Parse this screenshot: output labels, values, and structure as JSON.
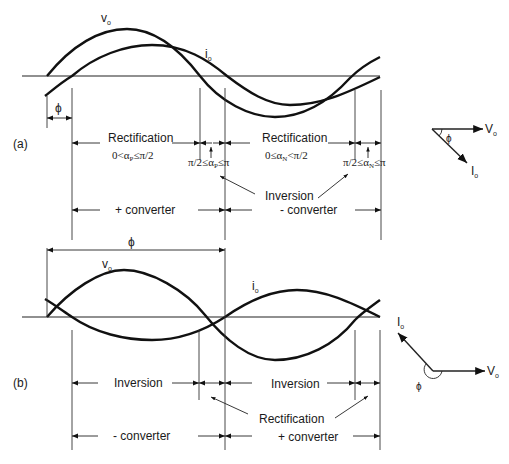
{
  "figure": {
    "part_a": {
      "label": "(a)",
      "curve_labels": {
        "vo": "v",
        "vo_sub": "o",
        "io": "i",
        "io_sub": "o"
      },
      "phi_label": "ϕ",
      "regions": [
        {
          "name": "Rectification",
          "condition": "0<α",
          "cond_sub": "P",
          "cond_tail": "≤π/2"
        },
        {
          "name": "Rectification",
          "condition": "0≤α",
          "cond_sub": "N",
          "cond_tail": "<π/2"
        }
      ],
      "inversion_conditions": [
        {
          "head": "π/2≤α",
          "sub": "P",
          "tail": "≤π"
        },
        {
          "head": "π/2≤α",
          "sub": "N",
          "tail": "≤π"
        }
      ],
      "inversion_label": "Inversion",
      "converters": [
        "+ converter",
        "- converter"
      ],
      "phasor": {
        "v_label": "V",
        "v_sub": "o",
        "i_label": "I",
        "i_sub": "o",
        "angle": "ϕ"
      }
    },
    "part_b": {
      "label": "(b)",
      "curve_labels": {
        "vo": "v",
        "vo_sub": "o",
        "io": "i",
        "io_sub": "o"
      },
      "phi_label": "ϕ",
      "regions": [
        "Inversion",
        "Inversion"
      ],
      "rectification_label": "Rectification",
      "converters": [
        "- converter",
        "+ converter"
      ],
      "phasor": {
        "v_label": "V",
        "v_sub": "o",
        "i_label": "I",
        "i_sub": "o",
        "angle": "ϕ"
      }
    }
  }
}
